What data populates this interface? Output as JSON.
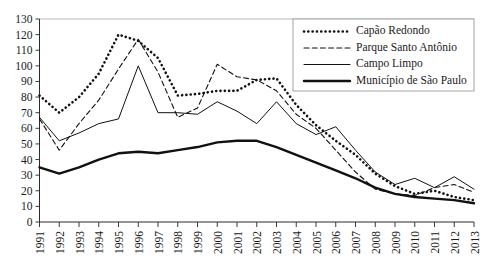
{
  "chart_data": {
    "type": "line",
    "title": "",
    "subtitle": "",
    "xlabel": "",
    "ylabel": "",
    "grid": false,
    "legend_position": "top-right",
    "ylim": [
      0,
      130
    ],
    "ytick_step": 10,
    "yticks": [
      0,
      10,
      20,
      30,
      40,
      50,
      60,
      70,
      80,
      90,
      100,
      110,
      120,
      130
    ],
    "x": [
      1991,
      1992,
      1993,
      1994,
      1995,
      1996,
      1997,
      1998,
      1999,
      2000,
      2001,
      2002,
      2003,
      2004,
      2005,
      2006,
      2007,
      2008,
      2009,
      2010,
      2011,
      2012,
      2013
    ],
    "categories": [
      "1991",
      "1992",
      "1993",
      "1994",
      "1995",
      "1996",
      "1997",
      "1998",
      "1999",
      "2000",
      "2001",
      "2002",
      "2003",
      "2004",
      "2005",
      "2006",
      "2007",
      "2008",
      "2009",
      "2010",
      "2011",
      "2012",
      "2013"
    ],
    "series": [
      {
        "name": "Capão Redondo",
        "style": "dotted",
        "color": "#111111",
        "values": [
          81,
          70,
          80,
          95,
          120,
          116,
          105,
          81,
          82,
          84,
          84,
          91,
          92,
          75,
          62,
          52,
          43,
          31,
          23,
          18,
          20,
          16,
          14
        ]
      },
      {
        "name": "Parque Santo Antônio",
        "style": "dashed",
        "color": "#111111",
        "values": [
          66,
          46,
          63,
          78,
          98,
          117,
          96,
          67,
          73,
          101,
          93,
          91,
          84,
          69,
          60,
          46,
          32,
          21,
          18,
          17,
          22,
          24,
          19
        ]
      },
      {
        "name": "Campo Limpo",
        "style": "thin-solid",
        "color": "#111111",
        "values": [
          67,
          52,
          57,
          63,
          66,
          100,
          70,
          70,
          69,
          77,
          71,
          63,
          77,
          63,
          56,
          61,
          46,
          32,
          24,
          28,
          22,
          29,
          21
        ]
      },
      {
        "name": "Município de São Paulo",
        "style": "thick-solid",
        "color": "#111111",
        "values": [
          35,
          31,
          35,
          40,
          44,
          45,
          44,
          46,
          48,
          51,
          52,
          52,
          48,
          43,
          38,
          33,
          28,
          22,
          18,
          16,
          15,
          14,
          12
        ]
      }
    ]
  },
  "legend": {
    "items": [
      {
        "label": "Capão Redondo",
        "style": "dotted"
      },
      {
        "label": "Parque Santo Antônio",
        "style": "dashed"
      },
      {
        "label": "Campo Limpo",
        "style": "thin-solid"
      },
      {
        "label": "Município de São Paulo",
        "style": "thick-solid"
      }
    ]
  }
}
